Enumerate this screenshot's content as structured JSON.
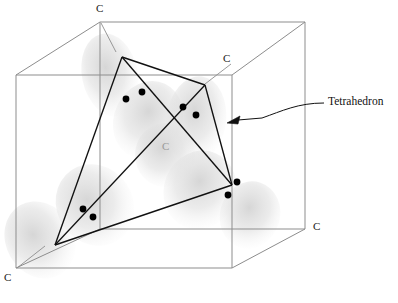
{
  "figure": {
    "colors": {
      "cube_line": "#8d8d8d",
      "tetrahedron_line": "#111111",
      "electron_dot": "#000000",
      "orbital_cloud": "#d9d9d9",
      "label_text": "#1a1a1a",
      "ghost_label_text": "#9a9a9a",
      "background": "#ffffff"
    },
    "cube": {
      "front_face": [
        [
          16,
          75
        ],
        [
          232,
          75
        ],
        [
          232,
          268
        ],
        [
          16,
          268
        ]
      ],
      "back_face": [
        [
          100,
          22
        ],
        [
          305,
          22
        ],
        [
          305,
          229
        ],
        [
          100,
          229
        ]
      ]
    },
    "tetrahedron": {
      "vertices": [
        [
          122,
          57
        ],
        [
          205,
          85
        ],
        [
          55,
          245
        ],
        [
          232,
          185
        ]
      ],
      "edges": [
        [
          0,
          1
        ],
        [
          0,
          2
        ],
        [
          0,
          3
        ],
        [
          1,
          2
        ],
        [
          1,
          3
        ],
        [
          2,
          3
        ]
      ]
    },
    "orbital_clouds": [
      {
        "cx": 110,
        "cy": 75,
        "rx": 28,
        "ry": 42,
        "rot": -12
      },
      {
        "cx": 148,
        "cy": 120,
        "rx": 34,
        "ry": 40,
        "rot": 25
      },
      {
        "cx": 196,
        "cy": 120,
        "rx": 30,
        "ry": 44,
        "rot": 8
      },
      {
        "cx": 95,
        "cy": 205,
        "rx": 38,
        "ry": 42,
        "rot": -35
      },
      {
        "cx": 40,
        "cy": 240,
        "rx": 34,
        "ry": 40,
        "rot": -30
      },
      {
        "cx": 200,
        "cy": 190,
        "rx": 36,
        "ry": 40,
        "rot": 22
      },
      {
        "cx": 250,
        "cy": 215,
        "rx": 30,
        "ry": 34,
        "rot": 18
      },
      {
        "cx": 165,
        "cy": 155,
        "rx": 30,
        "ry": 32,
        "rot": 0
      }
    ],
    "electron_pairs": [
      {
        "name": "pair-upper-left",
        "dots": [
          [
            126,
            99
          ],
          [
            142,
            92
          ]
        ]
      },
      {
        "name": "pair-upper-right",
        "dots": [
          [
            183,
            107
          ],
          [
            196,
            115
          ]
        ]
      },
      {
        "name": "pair-lower-left",
        "dots": [
          [
            83,
            209
          ],
          [
            93,
            217
          ]
        ]
      },
      {
        "name": "pair-lower-right",
        "dots": [
          [
            237,
            182
          ],
          [
            228,
            195
          ]
        ]
      }
    ],
    "dot_radius": 3.4,
    "labels": [
      {
        "name": "carbon-label-top",
        "text": "C",
        "x": 96,
        "y": 8,
        "style": "normal"
      },
      {
        "name": "carbon-label-upper-right",
        "text": "C",
        "x": 223,
        "y": 58,
        "style": "normal"
      },
      {
        "name": "carbon-label-center",
        "text": "C",
        "x": 162,
        "y": 146,
        "style": "ghost"
      },
      {
        "name": "carbon-label-bottom-right",
        "text": "C",
        "x": 313,
        "y": 226,
        "style": "normal"
      },
      {
        "name": "carbon-label-bottom-left",
        "text": "C",
        "x": 4,
        "y": 277,
        "style": "normal"
      }
    ],
    "annotation": {
      "name": "tetrahedron-annotation",
      "text": "Tetrahedron",
      "x": 328,
      "y": 94,
      "leader_path": "M 324 103 C 300 103 285 110 266 117",
      "arrow_tip": [
        228,
        123
      ]
    },
    "leader_lines": [
      {
        "name": "leader-top-carbon",
        "from": [
          101,
          22
        ],
        "to": [
          116,
          52
        ]
      },
      {
        "name": "leader-upper-right-carbon",
        "from": [
          230,
          63
        ],
        "to": [
          205,
          84
        ]
      },
      {
        "name": "leader-bottom-left-carbon",
        "from": [
          17,
          269
        ],
        "to": [
          44,
          246
        ]
      }
    ]
  }
}
